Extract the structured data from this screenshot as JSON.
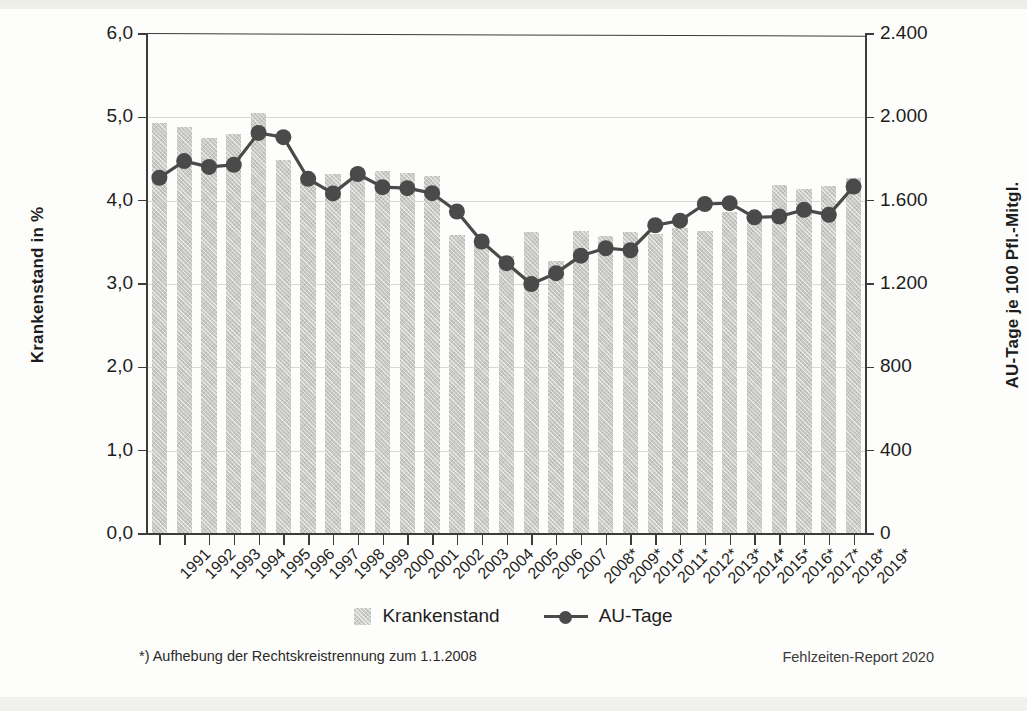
{
  "axes": {
    "ylabel_left": "Krankenstand in %",
    "ylabel_right": "AU-Tage je 100 Pfl.-Mitgl.",
    "yticks_left": [
      "0,0",
      "1,0",
      "2,0",
      "3,0",
      "4,0",
      "5,0",
      "6,0"
    ],
    "yticks_right": [
      "0",
      "400",
      "800",
      "1.200",
      "1.600",
      "2.000",
      "2.400"
    ]
  },
  "legend": {
    "bar_label": "Krankenstand",
    "line_label": "AU-Tage"
  },
  "footnote": "*) Aufhebung der Rechtskreistrennung zum 1.1.2008",
  "source": "Fehlzeiten-Report 2020",
  "colors": {
    "bar": "#c9c9c6",
    "line": "#4a4a4a",
    "axis": "#3c3c3c",
    "grid": "#d8d8d4",
    "background": "#fdfdfb"
  },
  "chart_data": {
    "type": "bar",
    "title": "",
    "subtitle": "",
    "xlabel": "",
    "ylabel": "Krankenstand in %",
    "ylabel_secondary": "AU-Tage je 100 Pfl.-Mitgl.",
    "ylim": [
      0,
      6
    ],
    "ylim_secondary": [
      0,
      2400
    ],
    "ytick_step": 1.0,
    "ytick_step_secondary": 400,
    "grid": true,
    "legend_position": "bottom-center",
    "categories": [
      "1991",
      "1992",
      "1993",
      "1994",
      "1995",
      "1996",
      "1997",
      "1998",
      "1999",
      "2000",
      "2001",
      "2002",
      "2003",
      "2004",
      "2005",
      "2006",
      "2007",
      "2008*",
      "2009*",
      "2010*",
      "2011*",
      "2012*",
      "2013*",
      "2014*",
      "2015*",
      "2016*",
      "2017*",
      "2018*",
      "2019*"
    ],
    "series": [
      {
        "name": "Krankenstand",
        "type": "bar",
        "axis": "left",
        "unit": "%",
        "values": [
          4.92,
          4.87,
          4.74,
          4.79,
          5.04,
          4.48,
          4.26,
          4.31,
          4.36,
          4.34,
          4.32,
          4.28,
          3.58,
          3.46,
          3.33,
          3.61,
          3.27,
          3.62,
          3.57,
          3.61,
          3.59,
          3.66,
          3.63,
          3.85,
          3.79,
          4.18,
          4.13,
          4.17,
          4.26
        ]
      },
      {
        "name": "AU-Tage",
        "type": "line",
        "axis": "right",
        "unit": "AU-Tage je 100 Pfl.-Mitgl.",
        "values": [
          1710,
          1790,
          1762,
          1772,
          1925,
          1905,
          1705,
          1635,
          1728,
          1665,
          1660,
          1636,
          1548,
          1404,
          1300,
          1200,
          1252,
          1336,
          1372,
          1362,
          1482,
          1504,
          1584,
          1588,
          1520,
          1524,
          1556,
          1532,
          1668
        ]
      }
    ]
  }
}
